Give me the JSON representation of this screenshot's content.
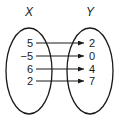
{
  "diagram": {
    "type": "mapping",
    "domain_label": "X",
    "range_label": "Y",
    "domain_values": [
      "5",
      "−5",
      "6",
      "2"
    ],
    "range_values": [
      "2",
      "0",
      "4",
      "7"
    ],
    "mappings": [
      {
        "from": "5",
        "to": "2"
      },
      {
        "from": "−5",
        "to": "0"
      },
      {
        "from": "6",
        "to": "4"
      },
      {
        "from": "2",
        "to": "7"
      }
    ],
    "colors": {
      "stroke": "#1a1a1a",
      "background": "#ffffff"
    }
  }
}
